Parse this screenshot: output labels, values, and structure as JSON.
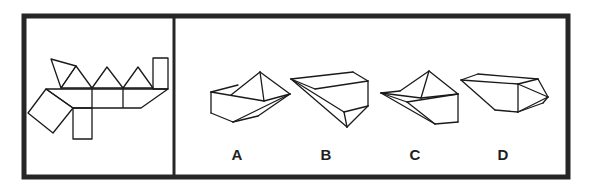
{
  "puzzle": {
    "type": "net-folding",
    "frame_color": "#262626",
    "line_color": "#1a1a1a",
    "net_panel": {
      "shapes": {
        "triangles": [
          [
            [
              51,
              59
            ],
            [
              76,
              66
            ],
            [
              61,
              88
            ]
          ],
          [
            [
              61,
              88
            ],
            [
              76,
              66
            ],
            [
              92,
              88
            ]
          ],
          [
            [
              92,
              88
            ],
            [
              107,
              67
            ],
            [
              123,
              88
            ]
          ],
          [
            [
              123,
              88
            ],
            [
              138,
              67
            ],
            [
              153,
              88
            ]
          ]
        ],
        "rect_top_right": [
          [
            153,
            58
          ],
          [
            168,
            58
          ],
          [
            168,
            89
          ],
          [
            153,
            89
          ]
        ],
        "band": [
          [
            46,
            89
          ],
          [
            168,
            89
          ],
          [
            141,
            108
          ],
          [
            73,
            108
          ]
        ],
        "band_dividers": [
          [
            [
              92,
              89
            ],
            [
              92,
              108
            ]
          ],
          [
            [
              123,
              89
            ],
            [
              123,
              108
            ]
          ]
        ],
        "square_left": [
          [
            46,
            89
          ],
          [
            73,
            108
          ],
          [
            53,
            133
          ],
          [
            28,
            113
          ]
        ],
        "rect_bottom": [
          [
            73,
            108
          ],
          [
            92,
            108
          ],
          [
            92,
            139
          ],
          [
            73,
            139
          ]
        ]
      }
    },
    "options": [
      {
        "label": "A",
        "label_pos": [
          237,
          150
        ],
        "lines": [
          [
            [
              211,
              92
            ],
            [
              238,
              85
            ]
          ],
          [
            [
              231,
              95
            ],
            [
              260,
              72
            ]
          ],
          [
            [
              260,
              72
            ],
            [
              290,
              94
            ]
          ],
          [
            [
              260,
              72
            ],
            [
              264,
              101
            ]
          ],
          [
            [
              211,
              92
            ],
            [
              264,
              101
            ]
          ],
          [
            [
              264,
              101
            ],
            [
              290,
              94
            ]
          ],
          [
            [
              211,
              92
            ],
            [
              211,
              113
            ]
          ],
          [
            [
              211,
              113
            ],
            [
              233,
              122
            ]
          ],
          [
            [
              233,
              122
            ],
            [
              290,
              94
            ]
          ],
          [
            [
              233,
              122
            ],
            [
              258,
              116
            ]
          ],
          [
            [
              258,
              116
            ],
            [
              290,
              94
            ]
          ]
        ]
      },
      {
        "label": "B",
        "label_pos": [
          326,
          150
        ],
        "lines": [
          [
            [
              291,
              79
            ],
            [
              353,
              72
            ]
          ],
          [
            [
              353,
              72
            ],
            [
              368,
              81
            ]
          ],
          [
            [
              291,
              79
            ],
            [
              315,
              89
            ]
          ],
          [
            [
              315,
              89
            ],
            [
              368,
              81
            ]
          ],
          [
            [
              291,
              79
            ],
            [
              344,
              112
            ]
          ],
          [
            [
              291,
              79
            ],
            [
              347,
              127
            ]
          ],
          [
            [
              344,
              112
            ],
            [
              368,
              106
            ]
          ],
          [
            [
              368,
              81
            ],
            [
              368,
              106
            ]
          ],
          [
            [
              344,
              112
            ],
            [
              347,
              127
            ]
          ],
          [
            [
              347,
              127
            ],
            [
              368,
              106
            ]
          ]
        ]
      },
      {
        "label": "C",
        "label_pos": [
          415,
          150
        ],
        "lines": [
          [
            [
              381,
              93
            ],
            [
              400,
              91
            ]
          ],
          [
            [
              400,
              91
            ],
            [
              429,
              71
            ]
          ],
          [
            [
              429,
              71
            ],
            [
              458,
              94
            ]
          ],
          [
            [
              429,
              71
            ],
            [
              421,
              98
            ]
          ],
          [
            [
              381,
              93
            ],
            [
              421,
              98
            ]
          ],
          [
            [
              421,
              98
            ],
            [
              458,
              94
            ]
          ],
          [
            [
              381,
              93
            ],
            [
              407,
              102
            ]
          ],
          [
            [
              407,
              102
            ],
            [
              458,
              94
            ]
          ],
          [
            [
              381,
              93
            ],
            [
              435,
              124
            ]
          ],
          [
            [
              407,
              102
            ],
            [
              435,
              124
            ]
          ],
          [
            [
              435,
              124
            ],
            [
              458,
              122
            ]
          ],
          [
            [
              458,
              94
            ],
            [
              458,
              122
            ]
          ]
        ]
      },
      {
        "label": "D",
        "label_pos": [
          503,
          150
        ],
        "lines": [
          [
            [
              461,
              80
            ],
            [
              478,
              74
            ]
          ],
          [
            [
              478,
              74
            ],
            [
              538,
              79
            ]
          ],
          [
            [
              461,
              80
            ],
            [
              518,
              84
            ]
          ],
          [
            [
              518,
              84
            ],
            [
              538,
              79
            ]
          ],
          [
            [
              538,
              79
            ],
            [
              548,
              97
            ]
          ],
          [
            [
              518,
              84
            ],
            [
              548,
              97
            ]
          ],
          [
            [
              461,
              80
            ],
            [
              495,
              110
            ]
          ],
          [
            [
              495,
              110
            ],
            [
              518,
              112
            ]
          ],
          [
            [
              518,
              84
            ],
            [
              518,
              112
            ]
          ],
          [
            [
              518,
              112
            ],
            [
              543,
              103
            ]
          ],
          [
            [
              543,
              103
            ],
            [
              548,
              97
            ]
          ],
          [
            [
              518,
              112
            ],
            [
              548,
              97
            ]
          ]
        ]
      }
    ]
  }
}
